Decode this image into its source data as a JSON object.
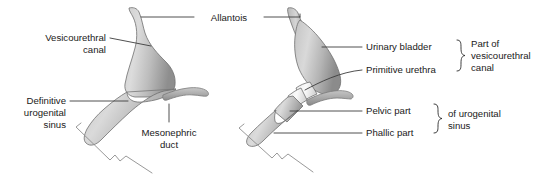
{
  "figure": {
    "background_color": "#ffffff",
    "line_color": "#3c3c3c",
    "organ_fill_light": "#d8d8d8",
    "organ_fill_mid": "#b5b5b5",
    "organ_fill_dark": "#8f8f8f",
    "urethra_fill": "#f2f2f2"
  },
  "shared_labels": {
    "allantois": "Allantois"
  },
  "left_panel": {
    "name": "earlier-stage",
    "labels": {
      "vesicourethral_canal_line1": "Vesicourethral",
      "vesicourethral_canal_line2": "canal",
      "definitive_sinus_line1": "Definitive",
      "definitive_sinus_line2": "urogenital",
      "definitive_sinus_line3": "sinus",
      "mesonephric_duct_line1": "Mesonephric",
      "mesonephric_duct_line2": "duct"
    }
  },
  "right_panel": {
    "name": "later-stage",
    "labels": {
      "urinary_bladder": "Urinary bladder",
      "primitive_urethra": "Primitive urethra",
      "pelvic_part": "Pelvic part",
      "phallic_part": "Phallic part"
    },
    "groups": {
      "upper_line1": "Part of",
      "upper_line2": "vesicourethral",
      "upper_line3": "canal",
      "lower_line1": "of urogenital",
      "lower_line2": "sinus"
    }
  }
}
